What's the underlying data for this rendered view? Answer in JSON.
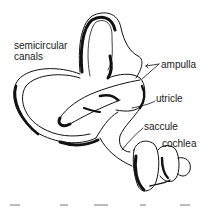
{
  "diagram": {
    "labels": {
      "semicircular_line1": "semicircular",
      "semicircular_line2": "canals",
      "ampulla": "ampulla",
      "utricle": "utricle",
      "saccule": "saccule",
      "cochlea": "cochlea"
    },
    "colors": {
      "ink": "#111111",
      "background": "#ffffff"
    }
  }
}
